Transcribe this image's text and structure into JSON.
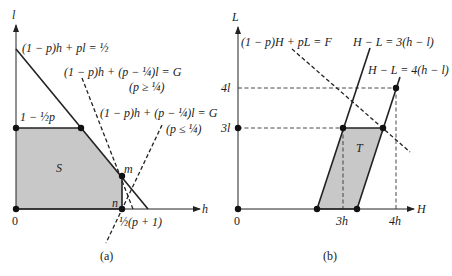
{
  "panel_a": {
    "caption": "(a)",
    "axis_x": "h",
    "axis_y": "l",
    "origin": "0",
    "region": "S",
    "line_solid": "(1 − p)h + pl = ½",
    "line_dashed_1": "(1 − p)h + (p − ¼)l = G",
    "cond_1": "(p ≥ ¼)",
    "line_dashed_2": "(1 − p)h + (p − ¼)l = G",
    "cond_2": "(p ≤ ¼)",
    "y_label": "1 − ½p",
    "point_m": "m",
    "point_n": "n",
    "x_label": "½(p + 1)"
  },
  "panel_b": {
    "caption": "(b)",
    "axis_x": "H",
    "axis_y": "L",
    "origin": "0",
    "region": "T",
    "line_dashed": "(1 − p)H + pL = F",
    "line_1": "H − L = 3(h − l)",
    "line_2": "H − L = 4(h − l)",
    "y_tick_1": "3l",
    "y_tick_2": "4l",
    "x_tick_1": "3h",
    "x_tick_2": "4h"
  },
  "colors": {
    "fill": "#c8c8c8",
    "line": "#1a1a1a"
  }
}
